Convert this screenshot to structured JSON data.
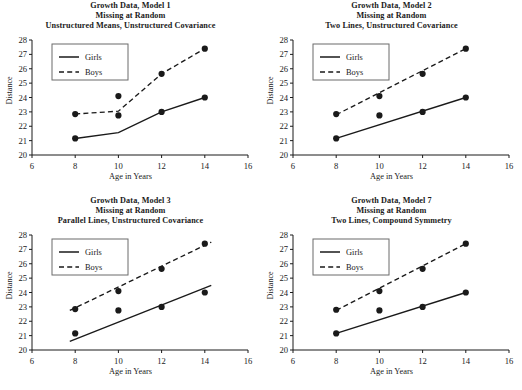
{
  "figure": {
    "panel_count": 4,
    "background_color": "#ffffff",
    "line_color": "#1a1a1a",
    "marker_color": "#1a1a1a"
  },
  "shared": {
    "xlabel": "Age in Years",
    "ylabel": "Distance",
    "xlim": [
      6,
      16
    ],
    "ylim": [
      20,
      28
    ],
    "xticks": [
      6,
      8,
      10,
      12,
      14,
      16
    ],
    "yticks": [
      20,
      21,
      22,
      23,
      24,
      25,
      26,
      27,
      28
    ],
    "xtick_labels": [
      "6",
      "8",
      "10",
      "12",
      "14",
      "16"
    ],
    "ytick_labels": [
      "20",
      "21",
      "22",
      "23",
      "24",
      "25",
      "26",
      "27",
      "28"
    ],
    "legend": {
      "position": "upper-left",
      "entries": [
        {
          "label": "Girls",
          "style": "solid"
        },
        {
          "label": "Boys",
          "style": "dashed"
        }
      ]
    },
    "title_line2": "Missing at Random",
    "title_line1_prefix": "Growth Data, Model "
  },
  "chart_data": [
    {
      "type": "line",
      "panel_id": "model-1",
      "title": "Growth Data, Model 1",
      "title_lines": [
        "Growth Data, Model 1",
        "Missing at Random",
        "Unstructured Means, Unstructured Covariance"
      ],
      "model_number": "1",
      "model_spec": "Unstructured Means, Unstructured Covariance",
      "xlabel": "Age in Years",
      "ylabel": "Distance",
      "xlim": [
        6,
        16
      ],
      "ylim": [
        20,
        28
      ],
      "grid": false,
      "legend_position": "upper-left",
      "x": [
        8,
        10,
        12,
        14
      ],
      "series": [
        {
          "name": "Girls",
          "style": "solid",
          "markers": {
            "x": [
              8,
              10,
              12,
              14
            ],
            "values": [
              21.15,
              22.75,
              23.0,
              24.0
            ]
          },
          "fit": {
            "x": [
              8,
              10,
              12,
              14
            ],
            "values": [
              21.15,
              21.55,
              23.0,
              24.0
            ]
          }
        },
        {
          "name": "Boys",
          "style": "dashed",
          "markers": {
            "x": [
              8,
              10,
              12,
              14
            ],
            "values": [
              22.85,
              24.1,
              25.65,
              27.4
            ]
          },
          "fit": {
            "x": [
              8,
              10,
              12,
              14
            ],
            "values": [
              22.85,
              23.05,
              25.65,
              27.4
            ]
          }
        }
      ]
    },
    {
      "type": "line",
      "panel_id": "model-2",
      "title": "Growth Data, Model 2",
      "title_lines": [
        "Growth Data, Model 2",
        "Missing at Random",
        "Two Lines, Unstructured Covariance"
      ],
      "model_number": "2",
      "model_spec": "Two Lines, Unstructured Covariance",
      "xlabel": "Age in Years",
      "ylabel": "Distance",
      "xlim": [
        6,
        16
      ],
      "ylim": [
        20,
        28
      ],
      "grid": false,
      "legend_position": "upper-left",
      "x": [
        8,
        10,
        12,
        14
      ],
      "series": [
        {
          "name": "Girls",
          "style": "solid",
          "markers": {
            "x": [
              8,
              10,
              12,
              14
            ],
            "values": [
              21.15,
              22.75,
              23.0,
              24.0
            ]
          },
          "fit": {
            "x": [
              8,
              14
            ],
            "values": [
              21.15,
              24.0
            ]
          }
        },
        {
          "name": "Boys",
          "style": "dashed",
          "markers": {
            "x": [
              8,
              10,
              12,
              14
            ],
            "values": [
              22.85,
              24.1,
              25.65,
              27.4
            ]
          },
          "fit": {
            "x": [
              8,
              14
            ],
            "values": [
              22.8,
              27.4
            ]
          }
        }
      ]
    },
    {
      "type": "line",
      "panel_id": "model-3",
      "title": "Growth Data, Model 3",
      "title_lines": [
        "Growth Data, Model 3",
        "Missing at Random",
        "Parallel Lines, Unstructured Covariance"
      ],
      "model_number": "3",
      "model_spec": "Parallel Lines, Unstructured Covariance",
      "xlabel": "Age in Years",
      "ylabel": "Distance",
      "xlim": [
        6,
        16
      ],
      "ylim": [
        20,
        28
      ],
      "grid": false,
      "legend_position": "upper-left",
      "x": [
        8,
        10,
        12,
        14
      ],
      "series": [
        {
          "name": "Girls",
          "style": "solid",
          "markers": {
            "x": [
              8,
              10,
              12,
              14
            ],
            "values": [
              21.15,
              22.75,
              23.0,
              24.0
            ]
          },
          "fit": {
            "x": [
              7.75,
              14.3
            ],
            "values": [
              20.6,
              24.5
            ]
          }
        },
        {
          "name": "Boys",
          "style": "dashed",
          "markers": {
            "x": [
              8,
              10,
              12,
              14
            ],
            "values": [
              22.85,
              24.1,
              25.65,
              27.4
            ]
          },
          "fit": {
            "x": [
              7.75,
              14.3
            ],
            "values": [
              22.75,
              27.5
            ]
          }
        }
      ]
    },
    {
      "type": "line",
      "panel_id": "model-7",
      "title": "Growth Data, Model 7",
      "title_lines": [
        "Growth Data, Model 7",
        "Missing at Random",
        "Two Lines, Compound Symmetry"
      ],
      "model_number": "7",
      "model_spec": "Two Lines, Compound Symmetry",
      "xlabel": "Age in Years",
      "ylabel": "Distance",
      "xlim": [
        6,
        16
      ],
      "ylim": [
        20,
        28
      ],
      "grid": false,
      "legend_position": "upper-left",
      "x": [
        8,
        10,
        12,
        14
      ],
      "series": [
        {
          "name": "Girls",
          "style": "solid",
          "markers": {
            "x": [
              8,
              10,
              12,
              14
            ],
            "values": [
              21.15,
              22.75,
              23.0,
              24.0
            ]
          },
          "fit": {
            "x": [
              8,
              14
            ],
            "values": [
              21.15,
              24.0
            ]
          }
        },
        {
          "name": "Boys",
          "style": "dashed",
          "markers": {
            "x": [
              8,
              10,
              12,
              14
            ],
            "values": [
              22.8,
              24.1,
              25.65,
              27.4
            ]
          },
          "fit": {
            "x": [
              8,
              14
            ],
            "values": [
              22.75,
              27.4
            ]
          }
        }
      ]
    }
  ]
}
